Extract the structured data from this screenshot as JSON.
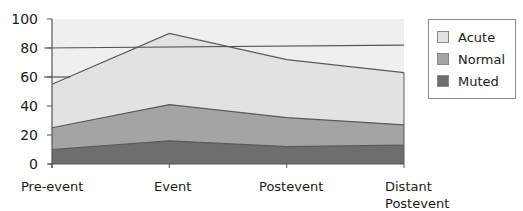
{
  "chart_data": {
    "type": "area",
    "stacked": false,
    "title": "",
    "xlabel": "",
    "ylabel": "",
    "ylim": [
      0,
      100
    ],
    "yticks": [
      0,
      20,
      40,
      60,
      80,
      100
    ],
    "categories": [
      "Pre-event",
      "Event",
      "Postevent",
      "Distant Postevent"
    ],
    "series": [
      {
        "name": "Acute",
        "values": [
          55,
          90,
          72,
          63
        ],
        "color": "#e2e2e2"
      },
      {
        "name": "Normal",
        "values": [
          25,
          41,
          32,
          27
        ],
        "color": "#a4a4a4"
      },
      {
        "name": "Muted",
        "values": [
          10,
          16,
          12,
          13
        ],
        "color": "#6e6e6e"
      }
    ],
    "reference_lines": [
      {
        "from": 80,
        "to": 82,
        "label": ""
      },
      {
        "at_pre_event_stub": 60
      }
    ],
    "legend_position": "right",
    "grid": false
  },
  "axis": {
    "y_labels": [
      "100",
      "80",
      "60",
      "40",
      "20",
      "0"
    ],
    "x_labels": [
      {
        "line1": "Pre-event",
        "line2": ""
      },
      {
        "line1": "Event",
        "line2": ""
      },
      {
        "line1": "Postevent",
        "line2": ""
      },
      {
        "line1": "Distant",
        "line2": "Postevent"
      }
    ]
  },
  "legend": {
    "items": [
      {
        "label": "Acute",
        "color": "#e2e2e2"
      },
      {
        "label": "Normal",
        "color": "#a4a4a4"
      },
      {
        "label": "Muted",
        "color": "#6e6e6e"
      }
    ]
  },
  "colors": {
    "plot_bg": "#efefef",
    "axis": "#555555",
    "outline": "#5a5a5a"
  }
}
